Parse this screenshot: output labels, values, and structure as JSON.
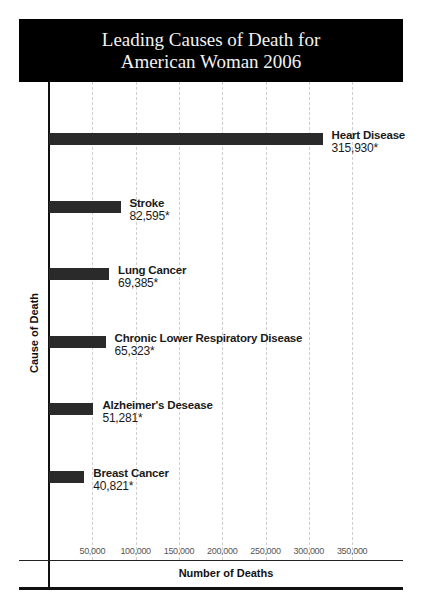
{
  "chart_data": {
    "type": "bar",
    "orientation": "horizontal",
    "title": "Leading Causes of Death for American Woman 2006",
    "title_lines": [
      "Leading Causes of Death for",
      "American Woman 2006"
    ],
    "xlabel": "Number of Deaths",
    "ylabel": "Cause of Death",
    "categories": [
      "Heart Disease",
      "Stroke",
      "Lung Cancer",
      "Chronic Lower Respiratory Disease",
      "Alzheimer's Desease",
      "Breast Cancer"
    ],
    "values": [
      315930,
      82595,
      69385,
      65323,
      51281,
      40821
    ],
    "value_labels": [
      "315,930*",
      "82,595*",
      "69,385*",
      "65,323*",
      "51,281*",
      "40,821*"
    ],
    "xticks": [
      "50,000",
      "100,000",
      "150,000",
      "200,000",
      "250,000",
      "300,000",
      "350,000"
    ],
    "xlim": [
      0,
      400000
    ],
    "grid": true,
    "bar_color": "#2a2a2a"
  }
}
